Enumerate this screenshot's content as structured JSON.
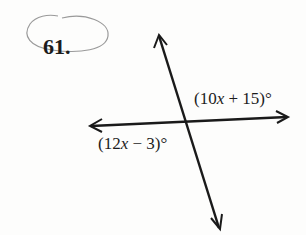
{
  "problem": {
    "number": "61."
  },
  "figure": {
    "type": "intersecting-lines",
    "line_color": "#1a1a1a",
    "circle_color": "#9a9a9a",
    "angles": [
      {
        "id": "upper-right",
        "prefix": "(10",
        "variable": "x",
        "suffix": " + 15)°",
        "expression": "(10x + 15)°"
      },
      {
        "id": "lower-left",
        "prefix": "(12",
        "variable": "x",
        "suffix": " − 3)°",
        "expression": "(12x − 3)°"
      }
    ]
  }
}
